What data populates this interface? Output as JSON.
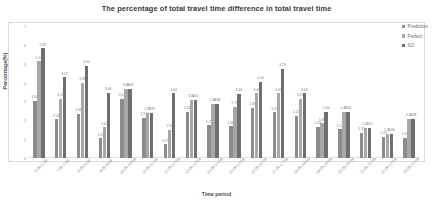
{
  "chart_data": {
    "type": "bar",
    "title": "The percentage of total travel time difference in total travel time",
    "xlabel": "Time period",
    "ylabel": "Percentage(%)",
    "ylim": [
      0,
      7
    ],
    "yticks": [
      "0",
      "1",
      "2",
      "3",
      "4",
      "5",
      "6",
      "7"
    ],
    "grid": false,
    "legend_position": "right",
    "categories": [
      "6:00-6:59",
      "7:00-7:59",
      "8:00-8:59",
      "9:00-9:59",
      "10:00-10:59",
      "11:00-11:59",
      "12:00-12:59",
      "13:00-13:59",
      "14:00-14:59",
      "15:00-15:59",
      "16:00-16:59",
      "17:00-17:59",
      "18:00-18:59",
      "19:00-19:59",
      "20:00-20:59",
      "21:00-21:59",
      "22:00-22:59",
      "23:00-23:59"
    ],
    "series": [
      {
        "name": "Prediction",
        "color": "#8c8c8c",
        "values": [
          3.05,
          2.05,
          2.35,
          1.05,
          3.13,
          2.13,
          0.73,
          2.45,
          1.73,
          1.68,
          2.66,
          2.43,
          2.25,
          1.64,
          1.52,
          1.33,
          1.13,
          1.08
        ],
        "labels": [
          "3.05",
          "2.05",
          "2.35",
          "1.05",
          "3.13",
          "2.13",
          "0.73",
          "2.45",
          "1.73",
          "1.68",
          "2.66",
          "2.43",
          "2.25",
          "1.64",
          "1.52",
          "1.33",
          "1.13",
          "1.08"
        ]
      },
      {
        "name": "Perfect",
        "color": "#a8a8a8",
        "values": [
          5.13,
          3.13,
          3.98,
          1.63,
          3.66,
          2.39,
          1.5,
          3.1,
          2.86,
          2.7,
          3.44,
          3.43,
          3.14,
          1.84,
          2.46,
          1.61,
          1.3,
          2.08
        ],
        "labels": [
          "5.13",
          "3.13",
          "3.98",
          "1.63",
          "3.66",
          "2.39",
          "1.50",
          "3.10",
          "2.86",
          "2.70",
          "3.44",
          "3.43",
          "3.14",
          "1.84",
          "2.46",
          "1.61",
          "1.30",
          "2.08"
        ]
      },
      {
        "name": "SO",
        "color": "#6f6f6f",
        "values": [
          5.82,
          4.27,
          4.9,
          3.46,
          3.66,
          2.39,
          3.44,
          3.1,
          2.86,
          3.4,
          4.05,
          4.73,
          3.43,
          2.46,
          2.46,
          1.61,
          1.3,
          2.08
        ],
        "labels": [
          "5.82",
          "4.27",
          "4.90",
          "3.46",
          "3.66",
          "2.39",
          "3.44",
          "3.10",
          "2.86",
          "3.40",
          "4.05",
          "4.73",
          "3.43",
          "2.46",
          "2.46",
          "1.61",
          "1.30",
          "2.08"
        ]
      }
    ]
  }
}
